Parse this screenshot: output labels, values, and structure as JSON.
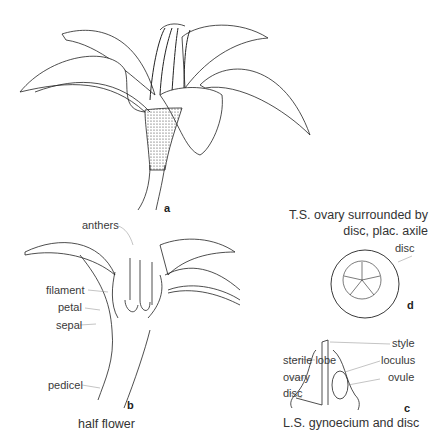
{
  "figures": {
    "a": {
      "letter": "a"
    },
    "b": {
      "letter": "b",
      "caption": "half flower",
      "labels": {
        "anthers": "anthers",
        "filament": "filament",
        "petal": "petal",
        "sepal": "sepal",
        "pedicel": "pedicel"
      }
    },
    "c": {
      "letter": "c",
      "caption": "L.S. gynoecium and disc",
      "labels": {
        "style": "style",
        "sterile_lobe": "sterile lobe",
        "loculus": "loculus",
        "ovary": "ovary",
        "ovule": "ovule",
        "disc": "disc"
      }
    },
    "d": {
      "letter": "d",
      "caption_line1": "T.S. ovary surrounded by",
      "caption_line2": "disc, plac. axile",
      "labels": {
        "disc": "disc"
      }
    }
  }
}
